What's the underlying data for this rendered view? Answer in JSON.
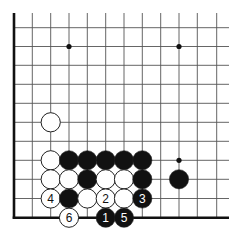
{
  "board": {
    "title": "Go problem diagram (lower-left corner)",
    "colors": {
      "background": "#ffffff",
      "line": "#555555",
      "edge": "#111111",
      "black_stone": "#111111",
      "white_stone": "#ffffff",
      "stone_outline": "#222222"
    },
    "grid": {
      "columns_x": [
        14,
        32.3,
        50.7,
        69,
        87.3,
        105.7,
        124,
        142.3,
        160.7,
        179,
        197.3,
        216.7
      ],
      "rows_y": [
        27.7,
        46.5,
        65.3,
        84.3,
        103.3,
        122.3,
        141.3,
        160.3,
        179.3,
        198.5,
        217.7
      ],
      "top_extent_y": 13,
      "right_extent_x": 229,
      "left_edge_visible": true,
      "bottom_edge_visible": true
    },
    "star_points": [
      {
        "col": 3,
        "row": 1
      },
      {
        "col": 9,
        "row": 1
      },
      {
        "col": 9,
        "row": 7
      }
    ],
    "stones": [
      {
        "col": 2,
        "row": 5,
        "color": "white",
        "label": ""
      },
      {
        "col": 2,
        "row": 7,
        "color": "white",
        "label": ""
      },
      {
        "col": 3,
        "row": 7,
        "color": "black",
        "label": ""
      },
      {
        "col": 4,
        "row": 7,
        "color": "black",
        "label": ""
      },
      {
        "col": 5,
        "row": 7,
        "color": "black",
        "label": ""
      },
      {
        "col": 6,
        "row": 7,
        "color": "black",
        "label": ""
      },
      {
        "col": 7,
        "row": 7,
        "color": "black",
        "label": ""
      },
      {
        "col": 2,
        "row": 8,
        "color": "white",
        "label": ""
      },
      {
        "col": 3,
        "row": 8,
        "color": "white",
        "label": ""
      },
      {
        "col": 4,
        "row": 8,
        "color": "black",
        "label": ""
      },
      {
        "col": 5,
        "row": 8,
        "color": "white",
        "label": ""
      },
      {
        "col": 6,
        "row": 8,
        "color": "white",
        "label": ""
      },
      {
        "col": 7,
        "row": 8,
        "color": "black",
        "label": ""
      },
      {
        "col": 9,
        "row": 8,
        "color": "black",
        "label": ""
      },
      {
        "col": 2,
        "row": 9,
        "color": "white",
        "label": "4"
      },
      {
        "col": 3,
        "row": 9,
        "color": "black",
        "label": ""
      },
      {
        "col": 4,
        "row": 9,
        "color": "white",
        "label": ""
      },
      {
        "col": 5,
        "row": 9,
        "color": "white",
        "label": "2"
      },
      {
        "col": 6,
        "row": 9,
        "color": "white",
        "label": ""
      },
      {
        "col": 7,
        "row": 9,
        "color": "black",
        "label": "3"
      },
      {
        "col": 3,
        "row": 10,
        "color": "white",
        "label": "6"
      },
      {
        "col": 5,
        "row": 10,
        "color": "black",
        "label": "1"
      },
      {
        "col": 6,
        "row": 10,
        "color": "black",
        "label": "5"
      }
    ],
    "stone_radius": 9.6
  }
}
